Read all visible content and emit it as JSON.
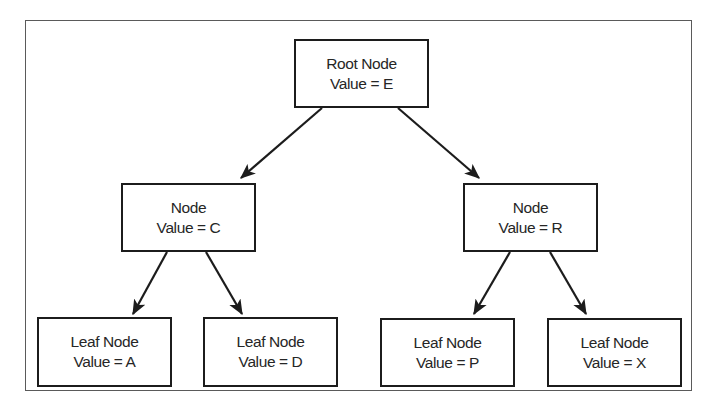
{
  "diagram": {
    "type": "binary-search-tree",
    "nodes": {
      "root": {
        "title": "Root Node",
        "value_label": "Value = E"
      },
      "node_c": {
        "title": "Node",
        "value_label": "Value = C"
      },
      "node_r": {
        "title": "Node",
        "value_label": "Value = R"
      },
      "leaf_a": {
        "title": "Leaf Node",
        "value_label": "Value = A"
      },
      "leaf_d": {
        "title": "Leaf Node",
        "value_label": "Value = D"
      },
      "leaf_p": {
        "title": "Leaf Node",
        "value_label": "Value = P"
      },
      "leaf_x": {
        "title": "Leaf Node",
        "value_label": "Value = X"
      }
    },
    "edges": [
      {
        "from": "root",
        "to": "node_c"
      },
      {
        "from": "root",
        "to": "node_r"
      },
      {
        "from": "node_c",
        "to": "leaf_a"
      },
      {
        "from": "node_c",
        "to": "leaf_d"
      },
      {
        "from": "node_r",
        "to": "leaf_p"
      },
      {
        "from": "node_r",
        "to": "leaf_x"
      }
    ],
    "colors": {
      "border": "#1c1c1c",
      "frame": "#5a5a5a",
      "text": "#262626",
      "background": "#ffffff"
    }
  }
}
